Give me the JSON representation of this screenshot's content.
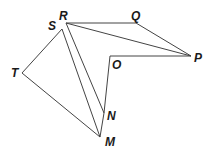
{
  "diagram": {
    "type": "geometry-figure",
    "points": {
      "R": {
        "x": 66,
        "y": 23,
        "label": "R",
        "lx": 59,
        "ly": 20
      },
      "Q": {
        "x": 136,
        "y": 23,
        "label": "Q",
        "lx": 131,
        "ly": 20
      },
      "P": {
        "x": 191,
        "y": 56,
        "label": "P",
        "lx": 194,
        "ly": 62
      },
      "O": {
        "x": 110,
        "y": 56,
        "label": "O",
        "lx": 112,
        "ly": 69
      },
      "N": {
        "x": 104,
        "y": 113,
        "label": "N",
        "lx": 107,
        "ly": 120
      },
      "M": {
        "x": 100,
        "y": 137,
        "label": "M",
        "lx": 105,
        "ly": 146
      },
      "T": {
        "x": 22,
        "y": 73,
        "label": "T",
        "lx": 11,
        "ly": 77
      },
      "S": {
        "x": 62,
        "y": 29,
        "label": "S",
        "lx": 48,
        "ly": 30
      }
    },
    "segments": [
      [
        "R",
        "Q"
      ],
      [
        "Q",
        "P"
      ],
      [
        "R",
        "P"
      ],
      [
        "P",
        "O"
      ],
      [
        "O",
        "N"
      ],
      [
        "N",
        "M"
      ],
      [
        "R",
        "N"
      ],
      [
        "S",
        "M"
      ],
      [
        "S",
        "T"
      ],
      [
        "T",
        "M"
      ]
    ],
    "stroke_color": "#444444",
    "label_color": "#1a1a1a"
  }
}
